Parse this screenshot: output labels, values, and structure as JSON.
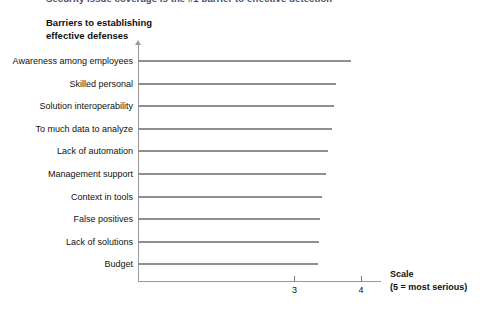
{
  "page": {
    "clipped_header_text": "Security issue coverage is the #1 barrier to effective detection",
    "chart_title_line1": "Barriers to establishing",
    "chart_title_line2": "effective defenses"
  },
  "legend": {
    "scale_label": "Scale",
    "scale_note": "(5 = most serious)"
  },
  "colors": {
    "bar": "#8f8f8f",
    "axis": "#9a9a9a",
    "text": "#111111",
    "header_text": "#4a4a6a"
  },
  "chart_data": {
    "type": "bar",
    "orientation": "horizontal",
    "title": "Barriers to establishing effective defenses",
    "xlabel": "Scale",
    "ylabel": "",
    "xlim": [
      0.65,
      4.3
    ],
    "grid": false,
    "legend": "none",
    "xticks": [
      3,
      4
    ],
    "xtick_labels": [
      "3",
      "4"
    ],
    "annotations": [
      "Scale",
      "(5 = most serious)"
    ],
    "categories": [
      "Awareness among employees",
      "Skilled personal",
      "Solution interoperability",
      "To much data to analyze",
      "Lack of automation",
      "Management support",
      "Context in tools",
      "False positives",
      "Lack of solutions",
      "Budget"
    ],
    "values": [
      3.85,
      3.62,
      3.6,
      3.56,
      3.5,
      3.47,
      3.42,
      3.39,
      3.37,
      3.35
    ]
  }
}
